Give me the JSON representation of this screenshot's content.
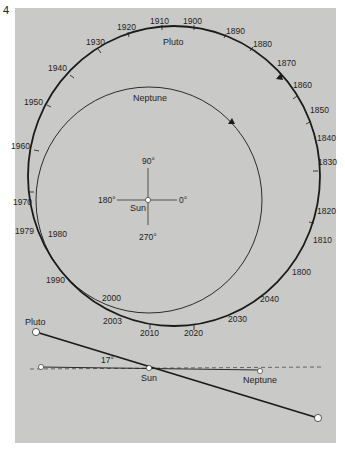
{
  "figure_number": "4",
  "colors": {
    "panel": "#c9c9c7",
    "line": "#1a1a1a",
    "dot": "#ffffff"
  },
  "top_view": {
    "pluto_label": "Pluto",
    "neptune_label": "Neptune",
    "sun_label": "Sun",
    "angles": {
      "a90": "90°",
      "a180": "180°",
      "a0": "0°",
      "a270": "270°"
    },
    "pluto_years": [
      {
        "label": "1910",
        "x": 162,
        "y": 22
      },
      {
        "label": "1900",
        "x": 193,
        "y": 22
      },
      {
        "label": "1890",
        "x": 228,
        "y": 31
      },
      {
        "label": "1880",
        "x": 260,
        "y": 45
      },
      {
        "label": "1870",
        "x": 284,
        "y": 65
      },
      {
        "label": "1860",
        "x": 297,
        "y": 86
      },
      {
        "label": "1850",
        "x": 310,
        "y": 111
      },
      {
        "label": "1840",
        "x": 317,
        "y": 140
      },
      {
        "label": "1830",
        "x": 320,
        "y": 163
      },
      {
        "label": "1820",
        "x": 320,
        "y": 212
      },
      {
        "label": "1810",
        "x": 314,
        "y": 242
      },
      {
        "label": "1800",
        "x": 295,
        "y": 274
      },
      {
        "label": "2040",
        "x": 263,
        "y": 302
      },
      {
        "label": "2030",
        "x": 238,
        "y": 322
      },
      {
        "label": "2020",
        "x": 196,
        "y": 335
      },
      {
        "label": "2010",
        "x": 151,
        "y": 335
      },
      {
        "label": "2003",
        "x": 125,
        "y": 324
      },
      {
        "label": "2000",
        "x": 112,
        "y": 303
      },
      {
        "label": "1990",
        "x": 57,
        "y": 283
      },
      {
        "label": "1980",
        "x": 58,
        "y": 236
      },
      {
        "label": "1979",
        "x": 16,
        "y": 233
      },
      {
        "label": "1970",
        "x": 14,
        "y": 204
      },
      {
        "label": "1960",
        "x": 12,
        "y": 148
      },
      {
        "label": "1950",
        "x": 24,
        "y": 104
      },
      {
        "label": "1940",
        "x": 48,
        "y": 70
      },
      {
        "label": "1930",
        "x": 86,
        "y": 44
      },
      {
        "label": "1920",
        "x": 118,
        "y": 30
      }
    ]
  },
  "side_view": {
    "pluto_label": "Pluto",
    "sun_label": "Sun",
    "neptune_label": "Neptune",
    "inclination_label": "17°"
  }
}
